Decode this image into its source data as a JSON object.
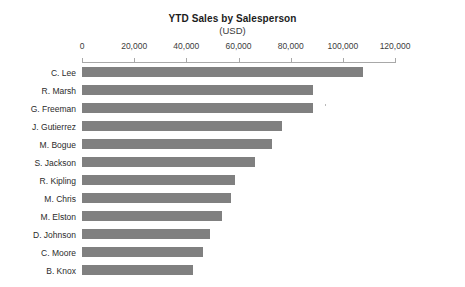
{
  "chart_data": {
    "type": "bar",
    "orientation": "horizontal",
    "title": "YTD Sales by Salesperson",
    "subtitle": "(USD)",
    "xlabel": "",
    "ylabel": "",
    "xlim": [
      0,
      120000
    ],
    "grid": false,
    "legend": false,
    "axis_position": "top",
    "bar_color": "#808080",
    "axis_color": "#a8a8a8",
    "xticks": [
      0,
      20000,
      40000,
      60000,
      80000,
      100000,
      120000
    ],
    "xtick_labels": [
      "0",
      "20,000",
      "40,000",
      "60,000",
      "80,000",
      "100,000",
      "120,000"
    ],
    "categories": [
      "C. Lee",
      "R. Marsh",
      "G. Freeman",
      "J. Gutierrez",
      "M. Bogue",
      "S. Jackson",
      "R. Kipling",
      "M. Chris",
      "M. Elston",
      "D. Johnson",
      "C. Moore",
      "B. Knox"
    ],
    "values": [
      107700,
      88500,
      88500,
      76500,
      72700,
      66200,
      58500,
      57300,
      53500,
      49200,
      46500,
      42700
    ]
  }
}
